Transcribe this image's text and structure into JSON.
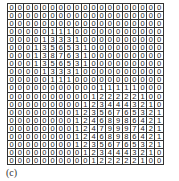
{
  "figure": {
    "caption": "(c)",
    "grid": {
      "rows": 20,
      "cols": 19,
      "values": [
        [
          0,
          0,
          0,
          0,
          0,
          0,
          0,
          0,
          0,
          0,
          0,
          0,
          0,
          0,
          0,
          0,
          0,
          0,
          0
        ],
        [
          0,
          0,
          0,
          0,
          0,
          0,
          0,
          0,
          0,
          0,
          0,
          0,
          0,
          0,
          0,
          0,
          0,
          0,
          0
        ],
        [
          0,
          0,
          0,
          0,
          0,
          0,
          0,
          0,
          0,
          0,
          0,
          0,
          0,
          0,
          0,
          0,
          0,
          0,
          0
        ],
        [
          0,
          0,
          0,
          0,
          0,
          1,
          1,
          1,
          0,
          0,
          0,
          0,
          0,
          0,
          0,
          0,
          0,
          0,
          0
        ],
        [
          0,
          0,
          0,
          0,
          1,
          3,
          3,
          3,
          1,
          0,
          0,
          0,
          0,
          0,
          0,
          0,
          0,
          0,
          0
        ],
        [
          0,
          0,
          0,
          1,
          3,
          5,
          6,
          5,
          3,
          1,
          0,
          0,
          0,
          0,
          0,
          0,
          0,
          0,
          0
        ],
        [
          0,
          0,
          0,
          1,
          3,
          8,
          7,
          6,
          3,
          1,
          0,
          0,
          0,
          0,
          0,
          0,
          0,
          0,
          0
        ],
        [
          0,
          0,
          0,
          1,
          3,
          5,
          6,
          5,
          3,
          1,
          0,
          0,
          0,
          0,
          0,
          0,
          0,
          0,
          0
        ],
        [
          0,
          0,
          0,
          0,
          1,
          3,
          3,
          3,
          1,
          0,
          0,
          0,
          0,
          0,
          0,
          0,
          0,
          0,
          0
        ],
        [
          0,
          0,
          0,
          0,
          0,
          1,
          1,
          1,
          0,
          0,
          0,
          0,
          0,
          0,
          0,
          0,
          0,
          0,
          0
        ],
        [
          0,
          0,
          0,
          0,
          0,
          0,
          0,
          0,
          0,
          0,
          0,
          1,
          1,
          1,
          1,
          1,
          0,
          0,
          0
        ],
        [
          0,
          0,
          0,
          0,
          0,
          0,
          0,
          0,
          0,
          0,
          1,
          2,
          2,
          2,
          2,
          2,
          1,
          0,
          0
        ],
        [
          0,
          0,
          0,
          0,
          0,
          0,
          0,
          0,
          0,
          1,
          2,
          3,
          4,
          4,
          4,
          3,
          2,
          1,
          0
        ],
        [
          0,
          0,
          0,
          0,
          0,
          0,
          0,
          0,
          1,
          2,
          3,
          5,
          6,
          7,
          6,
          5,
          3,
          2,
          1
        ],
        [
          0,
          0,
          0,
          0,
          0,
          0,
          0,
          0,
          1,
          2,
          4,
          6,
          8,
          9,
          8,
          6,
          4,
          2,
          1
        ],
        [
          0,
          0,
          0,
          0,
          0,
          0,
          0,
          0,
          1,
          2,
          4,
          7,
          9,
          9,
          9,
          7,
          4,
          2,
          1
        ],
        [
          0,
          0,
          0,
          0,
          0,
          0,
          0,
          0,
          1,
          2,
          4,
          6,
          8,
          9,
          8,
          6,
          4,
          2,
          1
        ],
        [
          0,
          0,
          0,
          0,
          0,
          0,
          0,
          0,
          1,
          2,
          3,
          5,
          6,
          7,
          6,
          5,
          3,
          2,
          1
        ],
        [
          0,
          0,
          0,
          0,
          0,
          0,
          0,
          0,
          0,
          1,
          2,
          3,
          4,
          4,
          4,
          3,
          2,
          1,
          0
        ],
        [
          0,
          0,
          0,
          0,
          0,
          0,
          0,
          0,
          0,
          0,
          1,
          2,
          2,
          2,
          2,
          2,
          1,
          0,
          0
        ]
      ]
    }
  },
  "chart_data": {
    "type": "heatmap",
    "title": "",
    "caption": "(c)",
    "xlabel": "",
    "ylabel": "",
    "grid": true,
    "rows": 20,
    "cols": 19,
    "values": [
      [
        0,
        0,
        0,
        0,
        0,
        0,
        0,
        0,
        0,
        0,
        0,
        0,
        0,
        0,
        0,
        0,
        0,
        0,
        0
      ],
      [
        0,
        0,
        0,
        0,
        0,
        0,
        0,
        0,
        0,
        0,
        0,
        0,
        0,
        0,
        0,
        0,
        0,
        0,
        0
      ],
      [
        0,
        0,
        0,
        0,
        0,
        0,
        0,
        0,
        0,
        0,
        0,
        0,
        0,
        0,
        0,
        0,
        0,
        0,
        0
      ],
      [
        0,
        0,
        0,
        0,
        0,
        1,
        1,
        1,
        0,
        0,
        0,
        0,
        0,
        0,
        0,
        0,
        0,
        0,
        0
      ],
      [
        0,
        0,
        0,
        0,
        1,
        3,
        3,
        3,
        1,
        0,
        0,
        0,
        0,
        0,
        0,
        0,
        0,
        0,
        0
      ],
      [
        0,
        0,
        0,
        1,
        3,
        5,
        6,
        5,
        3,
        1,
        0,
        0,
        0,
        0,
        0,
        0,
        0,
        0,
        0
      ],
      [
        0,
        0,
        0,
        1,
        3,
        8,
        7,
        6,
        3,
        1,
        0,
        0,
        0,
        0,
        0,
        0,
        0,
        0,
        0
      ],
      [
        0,
        0,
        0,
        1,
        3,
        5,
        6,
        5,
        3,
        1,
        0,
        0,
        0,
        0,
        0,
        0,
        0,
        0,
        0
      ],
      [
        0,
        0,
        0,
        0,
        1,
        3,
        3,
        3,
        1,
        0,
        0,
        0,
        0,
        0,
        0,
        0,
        0,
        0,
        0
      ],
      [
        0,
        0,
        0,
        0,
        0,
        1,
        1,
        1,
        0,
        0,
        0,
        0,
        0,
        0,
        0,
        0,
        0,
        0,
        0
      ],
      [
        0,
        0,
        0,
        0,
        0,
        0,
        0,
        0,
        0,
        0,
        0,
        1,
        1,
        1,
        1,
        1,
        0,
        0,
        0
      ],
      [
        0,
        0,
        0,
        0,
        0,
        0,
        0,
        0,
        0,
        0,
        1,
        2,
        2,
        2,
        2,
        2,
        1,
        0,
        0
      ],
      [
        0,
        0,
        0,
        0,
        0,
        0,
        0,
        0,
        0,
        1,
        2,
        3,
        4,
        4,
        4,
        3,
        2,
        1,
        0
      ],
      [
        0,
        0,
        0,
        0,
        0,
        0,
        0,
        0,
        1,
        2,
        3,
        5,
        6,
        7,
        6,
        5,
        3,
        2,
        1
      ],
      [
        0,
        0,
        0,
        0,
        0,
        0,
        0,
        0,
        1,
        2,
        4,
        6,
        8,
        9,
        8,
        6,
        4,
        2,
        1
      ],
      [
        0,
        0,
        0,
        0,
        0,
        0,
        0,
        0,
        1,
        2,
        4,
        7,
        9,
        9,
        9,
        7,
        4,
        2,
        1
      ],
      [
        0,
        0,
        0,
        0,
        0,
        0,
        0,
        0,
        1,
        2,
        4,
        6,
        8,
        9,
        8,
        6,
        4,
        2,
        1
      ],
      [
        0,
        0,
        0,
        0,
        0,
        0,
        0,
        0,
        1,
        2,
        3,
        5,
        6,
        7,
        6,
        5,
        3,
        2,
        1
      ],
      [
        0,
        0,
        0,
        0,
        0,
        0,
        0,
        0,
        0,
        1,
        2,
        3,
        4,
        4,
        4,
        3,
        2,
        1,
        0
      ],
      [
        0,
        0,
        0,
        0,
        0,
        0,
        0,
        0,
        0,
        0,
        1,
        2,
        2,
        2,
        2,
        2,
        1,
        0,
        0
      ]
    ]
  }
}
